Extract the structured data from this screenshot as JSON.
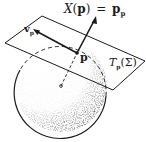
{
  "figure": {
    "title_formula": {
      "lhs_symbol": "X",
      "lhs_arg_open": "(",
      "lhs_arg": "p",
      "lhs_arg_close": ")",
      "equals": "=",
      "rhs_base": "p",
      "rhs_sub": "p"
    },
    "point_label": "p",
    "vector_label_base": "v",
    "vector_label_sub": "p",
    "plane_label_base": "T",
    "plane_label_sub": "p",
    "plane_label_arg": "(Σ)"
  },
  "colors": {
    "ink": "#1a1a1a",
    "background": "#ffffff"
  }
}
